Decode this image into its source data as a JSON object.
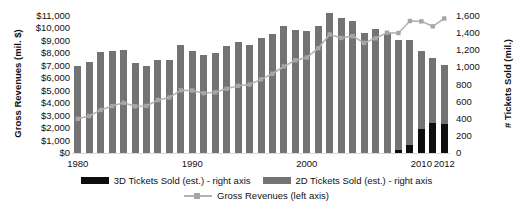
{
  "top_cut_text": "",
  "axes": {
    "y_left_title": "Gross Revenues (mil. $)",
    "y_right_title": "# Tickets Sold (mil.)",
    "y_left_ticks": [
      "$11,000",
      "$10,000",
      "$9,000",
      "$8,000",
      "$7,000",
      "$6,000",
      "$5,000",
      "$4,000",
      "$3,000",
      "$2,000",
      "$1,000",
      "$0"
    ],
    "y_right_ticks": [
      "1,600",
      "1,400",
      "1,200",
      "1,000",
      "800",
      "600",
      "400",
      "200",
      "0"
    ],
    "x_ticks": [
      "1980",
      "1990",
      "2000",
      "2010",
      "2012"
    ]
  },
  "legend": {
    "items": [
      {
        "label": "3D Tickets Sold (est.) - right axis",
        "swatch": "black"
      },
      {
        "label": "2D Tickets Sold (est.) - right axis",
        "swatch": "gray"
      },
      {
        "label": "Gross Revenues (left axis)",
        "swatch": "line"
      }
    ]
  },
  "colors": {
    "bar_2d": "#737373",
    "bar_3d": "#0d0d0d",
    "line": "#b3b3b3",
    "marker": "#a6a6a6",
    "axis": "#d9d9d9"
  },
  "chart_data": {
    "type": "bar",
    "title": "",
    "xlabel": "",
    "ylabel": "Gross Revenues (mil. $)",
    "ylabel_secondary": "# Tickets Sold (mil.)",
    "ylim": [
      0,
      11000
    ],
    "ylim_secondary": [
      0,
      1600
    ],
    "grid": false,
    "legend_position": "bottom",
    "categories": [
      "1980",
      "1981",
      "1982",
      "1983",
      "1984",
      "1985",
      "1986",
      "1987",
      "1988",
      "1989",
      "1990",
      "1991",
      "1992",
      "1993",
      "1994",
      "1995",
      "1996",
      "1997",
      "1998",
      "1999",
      "2000",
      "2001",
      "2002",
      "2003",
      "2004",
      "2005",
      "2006",
      "2007",
      "2008",
      "2009",
      "2010",
      "2011",
      "2012"
    ],
    "series": [
      {
        "name": "2D Tickets Sold (est.) - right axis",
        "axis": "right",
        "type": "bar",
        "values": [
          1022,
          1067,
          1175,
          1197,
          1199,
          1056,
          1017,
          1089,
          1085,
          1263,
          1189,
          1141,
          1173,
          1244,
          1292,
          1263,
          1339,
          1388,
          1481,
          1440,
          1421,
          1487,
          1639,
          1574,
          1536,
          1403,
          1449,
          1400,
          1325,
          1318,
          1186,
          1106,
          1024
        ]
      },
      {
        "name": "3D Tickets Sold (est.) - right axis",
        "axis": "right",
        "type": "bar",
        "values": [
          0,
          0,
          0,
          0,
          0,
          0,
          0,
          0,
          0,
          0,
          0,
          0,
          0,
          0,
          0,
          0,
          0,
          0,
          0,
          0,
          0,
          0,
          0,
          0,
          0,
          0,
          0,
          0,
          38,
          93,
          275,
          345,
          340
        ]
      },
      {
        "name": "Gross Revenues (left axis)",
        "axis": "left",
        "type": "line",
        "values": [
          2749,
          2966,
          3453,
          3766,
          4031,
          3749,
          3778,
          4253,
          4458,
          5033,
          5022,
          4803,
          4871,
          5154,
          5396,
          5494,
          5912,
          6366,
          6949,
          7448,
          7661,
          8413,
          9520,
          9239,
          9380,
          8840,
          9209,
          9660,
          9630,
          10600,
          10570,
          10170,
          10800
        ]
      }
    ]
  }
}
